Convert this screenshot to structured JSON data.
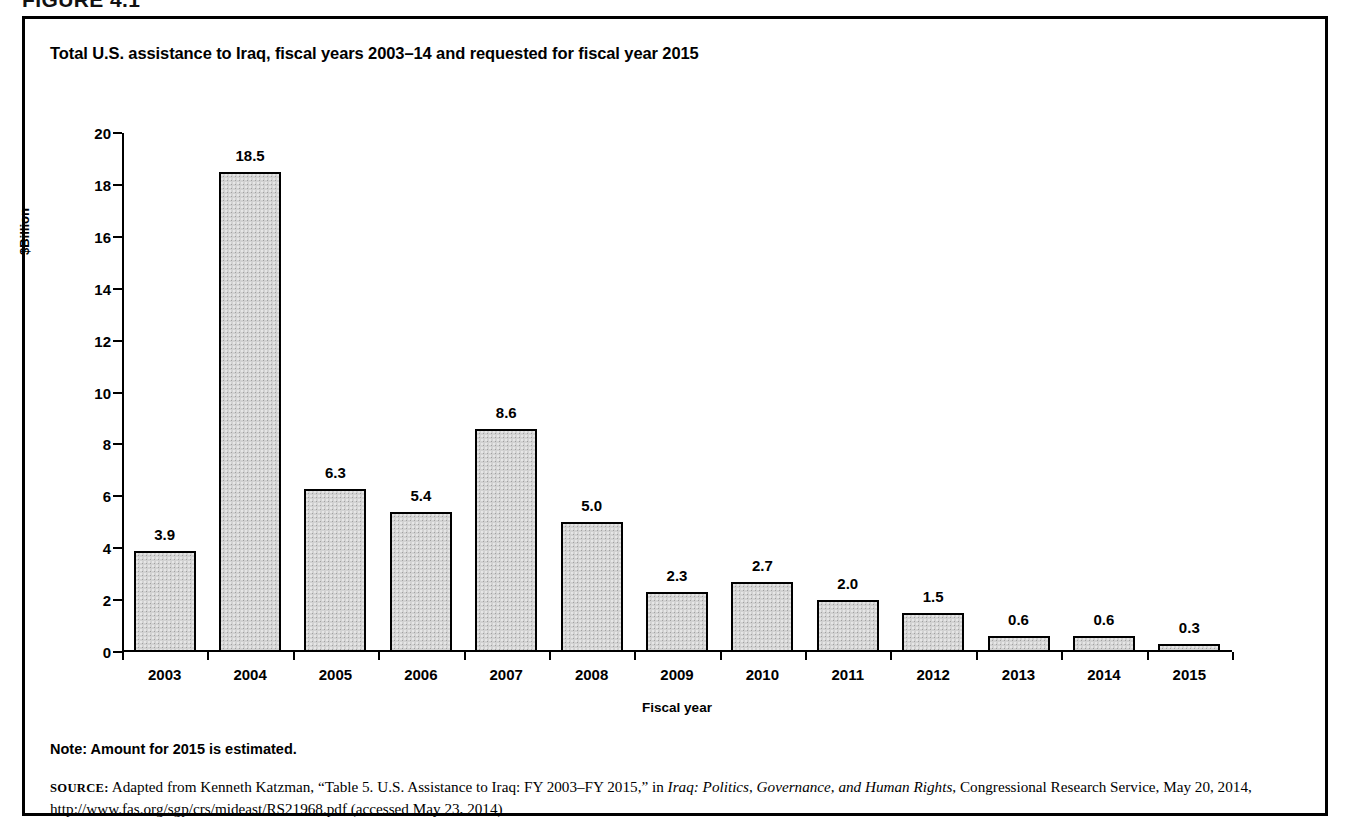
{
  "figure": {
    "number_label": "FIGURE 4.1",
    "title": "Total U.S. assistance to Iraq, fiscal years 2003–14 and requested for fiscal year 2015",
    "note": "Note: Amount for 2015 is estimated.",
    "source": {
      "prefix": "SOURCE:",
      "part1": " Adapted from Kenneth Katzman, “Table 5. U.S. Assistance to Iraq: FY 2003–FY 2015,” in ",
      "italic_title": "Iraq: Politics, Governance, and Human Rights",
      "part2": ", Congressional Research Service, May 20, 2014, http://www.fas.org/sgp/crs/mideast/RS21968.pdf (accessed May 23, 2014)"
    }
  },
  "chart_data": {
    "type": "bar",
    "title": "Total U.S. assistance to Iraq, fiscal years 2003–14 and requested for fiscal year 2015",
    "xlabel": "Fiscal year",
    "ylabel": "$Billion",
    "ylim": [
      0,
      20
    ],
    "ytick_step": 2,
    "yticks": [
      0,
      2,
      4,
      6,
      8,
      10,
      12,
      14,
      16,
      18,
      20
    ],
    "ytick_labels": [
      "0",
      "2",
      "4",
      "6",
      "8",
      "10",
      "12",
      "14",
      "16",
      "18",
      "20"
    ],
    "grid": false,
    "legend": "none",
    "bar_fill_color": "#d2d2d2",
    "bar_edge_color": "#000000",
    "categories": [
      "2003",
      "2004",
      "2005",
      "2006",
      "2007",
      "2008",
      "2009",
      "2010",
      "2011",
      "2012",
      "2013",
      "2014",
      "2015"
    ],
    "values": [
      3.9,
      18.5,
      6.3,
      5.4,
      8.6,
      5.0,
      2.3,
      2.7,
      2.0,
      1.5,
      0.6,
      0.6,
      0.3
    ],
    "value_labels": [
      "3.9",
      "18.5",
      "6.3",
      "5.4",
      "8.6",
      "5.0",
      "2.3",
      "2.7",
      "2.0",
      "1.5",
      "0.6",
      "0.6",
      "0.3"
    ],
    "series": [
      {
        "name": "Total U.S. assistance",
        "values": [
          3.9,
          18.5,
          6.3,
          5.4,
          8.6,
          5.0,
          2.3,
          2.7,
          2.0,
          1.5,
          0.6,
          0.6,
          0.3
        ]
      }
    ]
  }
}
